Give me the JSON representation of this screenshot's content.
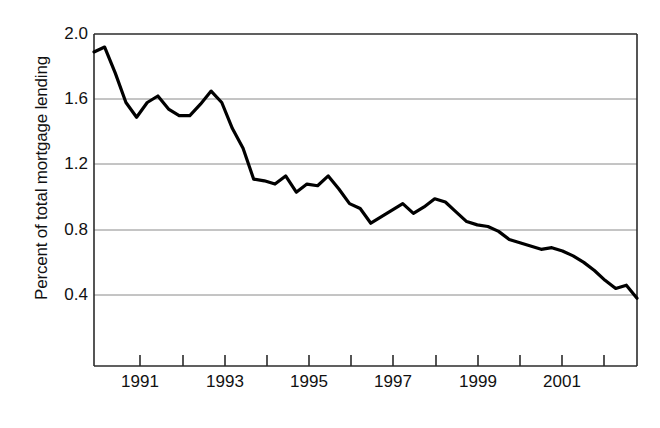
{
  "chart_data": {
    "type": "line",
    "title": "",
    "subtitle": "",
    "xlabel": "",
    "ylabel": "Percent of total mortgage lending",
    "ylim": [
      0.0,
      2.0
    ],
    "ytick_values": [
      2.0,
      1.6,
      1.2,
      0.8,
      0.4
    ],
    "ytick_labels": [
      "2.0",
      "1.6",
      "1.2",
      "0.8",
      "0.4"
    ],
    "xlim": [
      1990.0,
      2002.75
    ],
    "xtick_values": [
      1991,
      1992,
      1993,
      1994,
      1995,
      1996,
      1997,
      1998,
      1999,
      2000,
      2001,
      2002
    ],
    "xtick_labels": [
      "1991",
      "",
      "1993",
      "",
      "1995",
      "",
      "1997",
      "",
      "1999",
      "",
      "2001",
      ""
    ],
    "xtick_labels_shown": [
      "1991",
      "1993",
      "1995",
      "1997",
      "1999",
      "2001"
    ],
    "grid": true,
    "grid_axis": "y",
    "grid_color": "#808080",
    "line_color": "#000000",
    "line_width": 3,
    "legend": false,
    "legend_position": "none",
    "series": [
      {
        "name": "Percent of total mortgage lending",
        "x": [
          1990.0,
          1990.25,
          1990.5,
          1990.75,
          1991.0,
          1991.25,
          1991.5,
          1991.75,
          1992.0,
          1992.25,
          1992.5,
          1992.75,
          1993.0,
          1993.25,
          1993.5,
          1993.75,
          1994.0,
          1994.25,
          1994.5,
          1994.75,
          1995.0,
          1995.25,
          1995.5,
          1995.75,
          1996.0,
          1996.25,
          1996.5,
          1996.75,
          1997.0,
          1997.25,
          1997.5,
          1997.75,
          1998.0,
          1998.25,
          1998.5,
          1998.75,
          1999.0,
          1999.25,
          1999.5,
          1999.75,
          2000.0,
          2000.25,
          2000.5,
          2000.75,
          2001.0,
          2001.25,
          2001.5,
          2001.75,
          2002.0,
          2002.25,
          2002.5,
          2002.75
        ],
        "values": [
          1.89,
          1.92,
          1.76,
          1.58,
          1.49,
          1.58,
          1.62,
          1.54,
          1.5,
          1.5,
          1.57,
          1.65,
          1.58,
          1.42,
          1.3,
          1.11,
          1.1,
          1.08,
          1.13,
          1.03,
          1.08,
          1.07,
          1.13,
          1.05,
          0.96,
          0.93,
          0.84,
          0.88,
          0.92,
          0.96,
          0.9,
          0.94,
          0.99,
          0.97,
          0.91,
          0.85,
          0.83,
          0.82,
          0.79,
          0.74,
          0.72,
          0.7,
          0.68,
          0.69,
          0.67,
          0.64,
          0.6,
          0.55,
          0.49,
          0.44,
          0.46,
          0.38
        ]
      }
    ]
  },
  "axes": {
    "ylabel": "Percent of total mortgage lending",
    "ytick_labels": [
      "2.0",
      "1.6",
      "1.2",
      "0.8",
      "0.4"
    ],
    "xtick_labels": [
      "1991",
      "1993",
      "1995",
      "1997",
      "1999",
      "2001"
    ]
  }
}
